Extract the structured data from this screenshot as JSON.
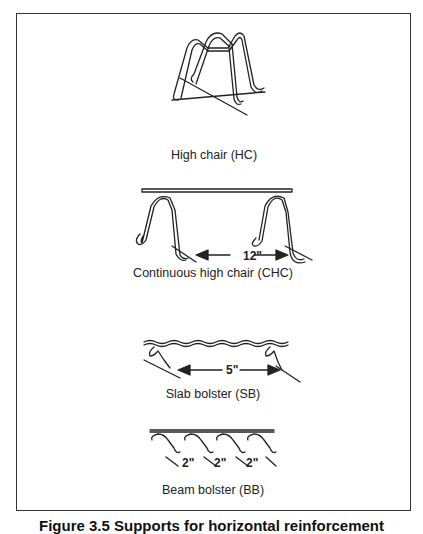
{
  "figure": {
    "items": [
      {
        "id": "hc",
        "label": "High chair (HC)"
      },
      {
        "id": "chc",
        "label": "Continuous high chair (CHC)",
        "dimension": "12\""
      },
      {
        "id": "sb",
        "label": "Slab bolster (SB)",
        "dimension": "5\""
      },
      {
        "id": "bb",
        "label": "Beam bolster (BB)",
        "dimensions": [
          "2\"",
          "2\"",
          "2\""
        ]
      }
    ],
    "caption": "Figure 3.5  Supports for horizontal reinforcement"
  },
  "colors": {
    "line": "#222222",
    "frame": "#333333",
    "background": "#ffffff"
  }
}
